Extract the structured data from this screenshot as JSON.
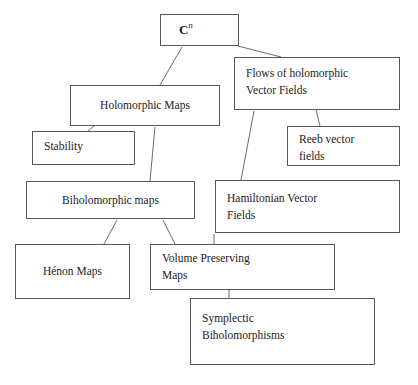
{
  "diagram": {
    "background_color": "#ffffff",
    "box_border_color": "#58585a",
    "text_color": "#1b1b1b",
    "edge_color": "#6b6b6d",
    "nodes": [
      {
        "id": "cn",
        "label": "C",
        "superscript": "n",
        "x": 160,
        "y": 14,
        "w": 79,
        "h": 32
      },
      {
        "id": "flows",
        "label": "Flows of holomorphic\nVector Fields",
        "x": 234,
        "y": 57,
        "w": 166,
        "h": 53
      },
      {
        "id": "holo",
        "label": "Holomorphic Maps",
        "x": 70,
        "y": 85,
        "w": 150,
        "h": 41
      },
      {
        "id": "stability",
        "label": "Stability",
        "x": 32,
        "y": 131,
        "w": 103,
        "h": 34
      },
      {
        "id": "reeb",
        "label": "Reeb vector\nfields",
        "x": 287,
        "y": 126,
        "w": 113,
        "h": 40
      },
      {
        "id": "bihol",
        "label": "Biholomorphic maps",
        "x": 26,
        "y": 181,
        "w": 169,
        "h": 38
      },
      {
        "id": "hamil",
        "label": "Hamiltonian Vector\nFields",
        "x": 215,
        "y": 180,
        "w": 185,
        "h": 53
      },
      {
        "id": "henon",
        "label": "Hénon Maps",
        "x": 15,
        "y": 244,
        "w": 115,
        "h": 55
      },
      {
        "id": "volume",
        "label": "Volume Preserving\nMaps",
        "x": 150,
        "y": 244,
        "w": 185,
        "h": 46
      },
      {
        "id": "sympl",
        "label": "Symplectic\nBiholomorphisms",
        "x": 190,
        "y": 298,
        "w": 185,
        "h": 67
      }
    ],
    "edges": [
      {
        "id": "cn-to-flows",
        "from": "cn",
        "to": "flows",
        "x1": 238,
        "y1": 46,
        "x2": 281,
        "y2": 57
      },
      {
        "id": "cn-to-holo",
        "from": "cn",
        "to": "holo",
        "x1": 182,
        "y1": 47,
        "x2": 160,
        "y2": 85
      },
      {
        "id": "holo-to-stability",
        "from": "holo",
        "to": "stability",
        "x1": 94,
        "y1": 126,
        "x2": 88,
        "y2": 131
      },
      {
        "id": "holo-to-bihol",
        "from": "holo",
        "to": "bihol",
        "x1": 155,
        "y1": 127,
        "x2": 150,
        "y2": 181
      },
      {
        "id": "flows-to-reeb",
        "from": "flows",
        "to": "reeb",
        "x1": 316,
        "y1": 110,
        "x2": 320,
        "y2": 126
      },
      {
        "id": "flows-to-hamil",
        "from": "flows",
        "to": "hamil",
        "x1": 254,
        "y1": 111,
        "x2": 241,
        "y2": 180
      },
      {
        "id": "bihol-to-henon",
        "from": "bihol",
        "to": "henon",
        "x1": 117,
        "y1": 220,
        "x2": 104,
        "y2": 244
      },
      {
        "id": "bihol-to-volume",
        "from": "bihol",
        "to": "volume",
        "x1": 163,
        "y1": 220,
        "x2": 175,
        "y2": 244
      },
      {
        "id": "hamil-to-volume",
        "from": "hamil",
        "to": "volume",
        "x1": 214,
        "y1": 234,
        "x2": 214,
        "y2": 244
      },
      {
        "id": "volume-to-sympl",
        "from": "volume",
        "to": "sympl",
        "x1": 229,
        "y1": 290,
        "x2": 229,
        "y2": 298
      }
    ]
  }
}
